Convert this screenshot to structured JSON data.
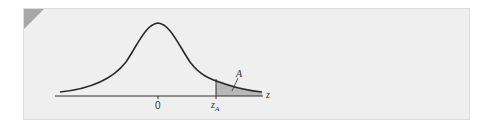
{
  "figure": {
    "type": "normal distribution diagram",
    "labels": {
      "mean": "0",
      "critical_value": "z",
      "critical_value_sub": "A",
      "area": "A",
      "axis": "z"
    },
    "colors": {
      "panel_bg": "#efefef",
      "corner_tab": "#a7a7a7",
      "curve": "#2a2a2a",
      "shaded_area": "#b8b8b8"
    }
  }
}
